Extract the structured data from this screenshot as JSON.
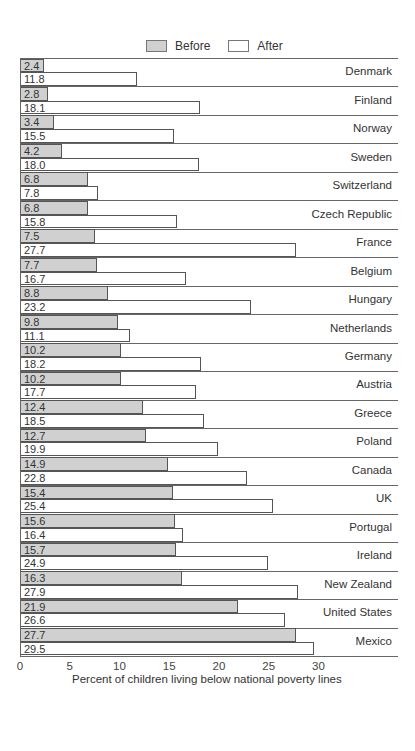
{
  "chart_data": {
    "type": "bar",
    "orientation": "horizontal",
    "title": "",
    "xlabel": "Percent of children living below national poverty lines",
    "ylabel": "",
    "xlim": [
      0,
      30
    ],
    "xticks": [
      "0",
      "5",
      "10",
      "15",
      "20",
      "25",
      "30"
    ],
    "legend": {
      "position": "top",
      "entries": [
        "Before",
        "After"
      ]
    },
    "grid": false,
    "categories": [
      "Denmark",
      "Finland",
      "Norway",
      "Sweden",
      "Switzerland",
      "Czech Republic",
      "France",
      "Belgium",
      "Hungary",
      "Netherlands",
      "Germany",
      "Austria",
      "Greece",
      "Poland",
      "Canada",
      "UK",
      "Portugal",
      "Ireland",
      "New Zealand",
      "United States",
      "Mexico"
    ],
    "series": [
      {
        "name": "Before",
        "color": "#d0d0d0",
        "values": [
          2.4,
          2.8,
          3.4,
          4.2,
          6.8,
          6.8,
          7.5,
          7.7,
          8.8,
          9.8,
          10.2,
          10.2,
          12.4,
          12.7,
          14.9,
          15.4,
          15.6,
          15.7,
          16.3,
          21.9,
          27.7
        ]
      },
      {
        "name": "After",
        "color": "#ffffff",
        "values": [
          11.8,
          18.1,
          15.5,
          18.0,
          7.8,
          15.8,
          27.7,
          16.7,
          23.2,
          11.1,
          18.2,
          17.7,
          18.5,
          19.9,
          22.8,
          25.4,
          16.4,
          24.9,
          27.9,
          26.6,
          29.5
        ]
      }
    ],
    "value_labels": {
      "before": [
        "2.4",
        "2.8",
        "3.4",
        "4.2",
        "6.8",
        "6.8",
        "7.5",
        "7.7",
        "8.8",
        "9.8",
        "10.2",
        "10.2",
        "12.4",
        "12.7",
        "14.9",
        "15.4",
        "15.6",
        "15.7",
        "16.3",
        "21.9",
        "27.7"
      ],
      "after": [
        "11.8",
        "18.1",
        "15.5",
        "18.0",
        "7.8",
        "15.8",
        "27.7",
        "16.7",
        "23.2",
        "11.1",
        "18.2",
        "17.7",
        "18.5",
        "19.9",
        "22.8",
        "25.4",
        "16.4",
        "24.9",
        "27.9",
        "26.6",
        "29.5"
      ]
    }
  }
}
